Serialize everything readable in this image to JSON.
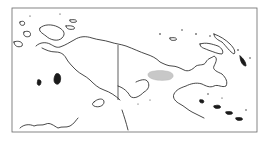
{
  "map": {
    "region": "New Guinea",
    "style": "outline",
    "colors": {
      "background": "#ffffff",
      "coastline": "#1a1a1a",
      "frame": "#555555",
      "highlight": "#c8c8c8"
    },
    "highlight_region": "highlighted-area",
    "features": [
      "coastline",
      "international-border",
      "islands",
      "highlighted-area"
    ]
  }
}
